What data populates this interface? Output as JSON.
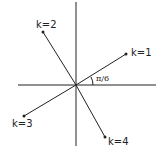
{
  "diagram": {
    "title": "",
    "angle_label": "π/6",
    "points": [
      {
        "label": "k=1"
      },
      {
        "label": "k=2"
      },
      {
        "label": "k=3"
      },
      {
        "label": "k=4"
      }
    ],
    "colors": {
      "ink": "#222222",
      "background": "#ffffff"
    }
  }
}
